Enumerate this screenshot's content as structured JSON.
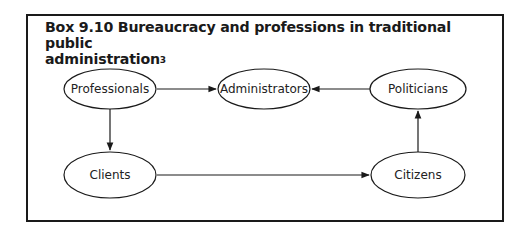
{
  "box": {
    "title": "Box 9.10  Bureaucracy and professions in traditional public administration",
    "title_line1": "Box 9.10  Bureaucracy and professions in traditional public",
    "title_line2": "administration",
    "footnote_marker": "3"
  },
  "diagram": {
    "nodes": [
      {
        "id": "professionals",
        "label": "Professionals",
        "cx": 110,
        "cy": 89,
        "rx": 46,
        "ry": 20
      },
      {
        "id": "administrators",
        "label": "Administrators",
        "cx": 264,
        "cy": 89,
        "rx": 46,
        "ry": 20
      },
      {
        "id": "politicians",
        "label": "Politicians",
        "cx": 418,
        "cy": 89,
        "rx": 48,
        "ry": 20
      },
      {
        "id": "clients",
        "label": "Clients",
        "cx": 110,
        "cy": 175,
        "rx": 46,
        "ry": 23
      },
      {
        "id": "citizens",
        "label": "Citizens",
        "cx": 418,
        "cy": 175,
        "rx": 47,
        "ry": 23
      }
    ],
    "edges": [
      {
        "from": "professionals",
        "to": "administrators"
      },
      {
        "from": "politicians",
        "to": "administrators"
      },
      {
        "from": "professionals",
        "to": "clients"
      },
      {
        "from": "clients",
        "to": "citizens"
      },
      {
        "from": "citizens",
        "to": "politicians"
      }
    ],
    "colors": {
      "stroke": "#1a1a1a",
      "text": "#222222",
      "background": "#ffffff"
    }
  }
}
